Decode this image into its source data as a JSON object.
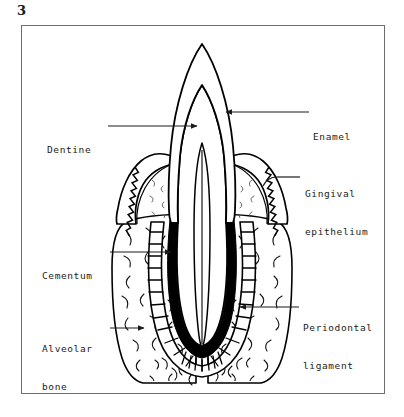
{
  "figure": {
    "number": "3"
  },
  "frame": {
    "x": 21,
    "y": 25,
    "width": 364,
    "height": 369,
    "border_color": "#6d6d6d",
    "background": "#ffffff"
  },
  "colors": {
    "ink": "#000000",
    "frame": "#6d6d6d",
    "text": "#1b1b1b",
    "cementum_fill": "#000000",
    "paper": "#ffffff"
  },
  "labels": [
    {
      "id": "enamel",
      "lines": [
        "Enamel"
      ],
      "side": "right",
      "text_x": 313,
      "text_y": 106,
      "leader": {
        "from_x": 309,
        "from_y": 112,
        "to_x": 224,
        "to_y": 112,
        "arrow": "to"
      }
    },
    {
      "id": "gingival-epithelium",
      "lines": [
        "Gingival",
        "epithelium"
      ],
      "side": "right",
      "text_x": 305,
      "text_y": 163,
      "leader": {
        "from_x": 300,
        "from_y": 177,
        "to_x": 277,
        "to_y": 177,
        "arrow": "none"
      }
    },
    {
      "id": "periodontal-ligament",
      "lines": [
        "Periodontal",
        "ligament"
      ],
      "side": "right",
      "text_x": 303,
      "text_y": 297,
      "leader": {
        "from_x": 299,
        "from_y": 307,
        "to_x": 238,
        "to_y": 307,
        "arrow": "to"
      }
    },
    {
      "id": "dentine",
      "lines": [
        "Dentine"
      ],
      "side": "left",
      "text_x": 47,
      "text_y": 119,
      "leader": {
        "from_x": 108,
        "from_y": 126,
        "to_x": 199,
        "to_y": 126,
        "arrow": "to"
      }
    },
    {
      "id": "cementum",
      "lines": [
        "Cementum"
      ],
      "side": "left",
      "text_x": 42,
      "text_y": 245,
      "leader": {
        "from_x": 110,
        "from_y": 252,
        "to_x": 173,
        "to_y": 252,
        "arrow": "to"
      }
    },
    {
      "id": "alveolar-bone",
      "lines": [
        "Alveolar",
        "bone"
      ],
      "side": "left",
      "text_x": 42,
      "text_y": 318,
      "leader": {
        "from_x": 110,
        "from_y": 328,
        "to_x": 146,
        "to_y": 328,
        "arrow": "to"
      }
    }
  ],
  "structures": [
    {
      "id": "enamel-crown",
      "name": "Enamel (outer crown layer)"
    },
    {
      "id": "dentine-body",
      "name": "Dentine (inner crown and root body)"
    },
    {
      "id": "pulp-cavity",
      "name": "Pulp cavity / root canal"
    },
    {
      "id": "gingiva-left",
      "name": "Gingiva, left flap"
    },
    {
      "id": "gingiva-right",
      "name": "Gingiva, right flap"
    },
    {
      "id": "gingival-epithelium-left",
      "name": "Gingival epithelium, sawtooth edge, left"
    },
    {
      "id": "gingival-epithelium-right",
      "name": "Gingival epithelium, sawtooth edge, right"
    },
    {
      "id": "cementum-layer",
      "name": "Cementum (thick dark root coating)"
    },
    {
      "id": "periodontal-ligament-band",
      "name": "Periodontal ligament (ladder band around root)"
    },
    {
      "id": "alveolar-bone-mass",
      "name": "Alveolar bone (stippled socket)"
    }
  ]
}
